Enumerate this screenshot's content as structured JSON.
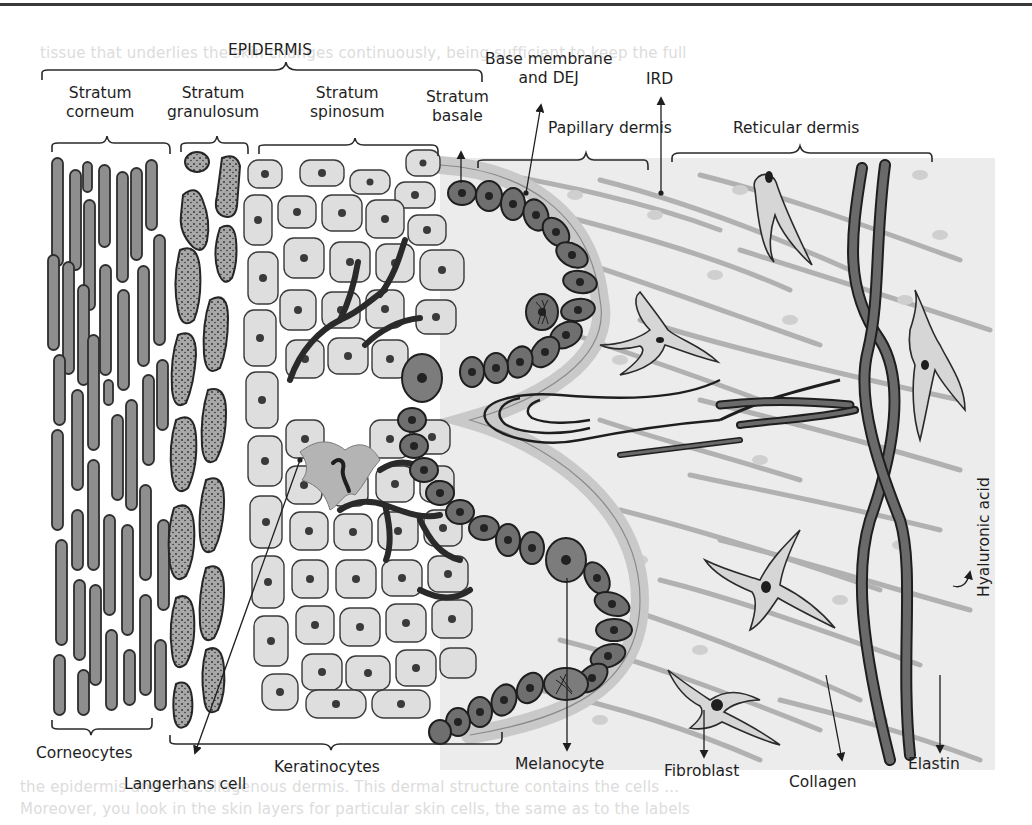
{
  "figure": {
    "background_text_bleed": [
      "tissue that underlies the skin changes continuously, being sufficient to keep the full",
      "the epidermis and the collagenous dermis. This dermal structure contains the cells ...",
      "Moreover, you look in the skin layers for particular skin cells, the same as to the labels"
    ],
    "colors": {
      "ink": "#1e1e1e",
      "corneocyte_fill": "#8c8c8c",
      "granular_fill": "#9a9a9a",
      "keratinocyte_fill": "#dcdcdc",
      "basal_fill": "#6e6e6e",
      "dermis_bg": "#efefef",
      "fiber": "#9c9c9c",
      "elastin": "#555555"
    }
  },
  "labels": {
    "epidermis": "EPIDERMIS",
    "stratum_corneum": [
      "Stratum",
      "corneum"
    ],
    "stratum_granulosum": [
      "Stratum",
      "granulosum"
    ],
    "stratum_spinosum": [
      "Stratum",
      "spinosum"
    ],
    "stratum_basale": [
      "Stratum",
      "basale"
    ],
    "base_membrane": [
      "Base membrane",
      "and DEJ"
    ],
    "ird": "IRD",
    "papillary_dermis": "Papillary dermis",
    "reticular_dermis": "Reticular dermis",
    "hyaluronic_acid": "Hyaluronic acid",
    "corneocytes": "Corneocytes",
    "langerhans_cell": "Langerhans cell",
    "keratinocytes": "Keratinocytes",
    "melanocyte": "Melanocyte",
    "fibroblast": "Fibroblast",
    "collagen": "Collagen",
    "elastin": "Elastin"
  }
}
